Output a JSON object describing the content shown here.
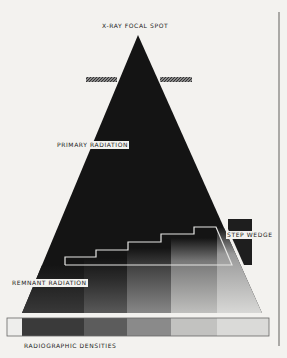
{
  "diagram": {
    "labels": {
      "focal_spot": "X-RAY FOCAL SPOT",
      "primary": "PRIMARY RADIATION",
      "step_wedge": "STEP WEDGE",
      "remnant": "REMNANT RADIATION",
      "densities": "RADIOGRAPHIC DENSITIES"
    },
    "colors": {
      "background": "#f3f2ef",
      "beam": "#141414",
      "collimator": "#555555",
      "wedge_outline": "#e8e8e8"
    },
    "density_steps": [
      {
        "index": 0,
        "shade": "#eeeeec"
      },
      {
        "index": 1,
        "shade": "#3a3a3a"
      },
      {
        "index": 2,
        "shade": "#5c5c5c"
      },
      {
        "index": 3,
        "shade": "#8a8a8a"
      },
      {
        "index": 4,
        "shade": "#c2c2c0"
      },
      {
        "index": 5,
        "shade": "#dadad8"
      }
    ]
  }
}
